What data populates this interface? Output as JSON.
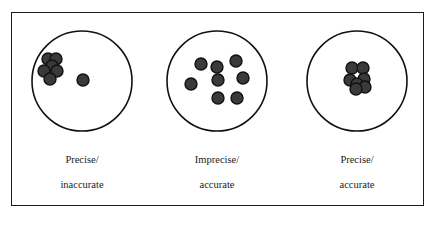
{
  "diagram": {
    "type": "target-precision-accuracy",
    "colors": {
      "frame": "#1a1a1a",
      "target_outline": "#111111",
      "dot_fill": "#3a3a3a",
      "dot_stroke": "#111111",
      "text": "#222222"
    },
    "targets": [
      {
        "id": "precise-inaccurate",
        "label_line1": "Precise/",
        "label_line2": "inaccurate",
        "center": [
          82,
          81
        ],
        "radius": 50,
        "dots": [
          [
            48,
            59
          ],
          [
            56,
            59
          ],
          [
            52,
            66
          ],
          [
            44,
            71
          ],
          [
            57,
            71
          ],
          [
            50,
            79
          ],
          [
            83,
            80
          ]
        ]
      },
      {
        "id": "imprecise-accurate",
        "label_line1": "Imprecise/",
        "label_line2": "accurate",
        "center": [
          217,
          81
        ],
        "radius": 50,
        "dots": [
          [
            201,
            64
          ],
          [
            217,
            67
          ],
          [
            236,
            61
          ],
          [
            191,
            84
          ],
          [
            218,
            80
          ],
          [
            243,
            78
          ],
          [
            218,
            98
          ],
          [
            237,
            98
          ]
        ]
      },
      {
        "id": "precise-accurate",
        "label_line1": "Precise/",
        "label_line2": "accurate",
        "center": [
          357,
          81
        ],
        "radius": 50,
        "dots": [
          [
            352,
            68
          ],
          [
            363,
            68
          ],
          [
            350,
            80
          ],
          [
            364,
            79
          ],
          [
            357,
            84
          ],
          [
            365,
            87
          ],
          [
            356,
            89
          ]
        ]
      }
    ]
  }
}
